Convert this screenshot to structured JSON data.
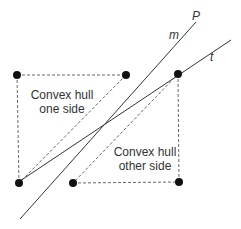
{
  "diagram": {
    "labels": {
      "line_p": "P",
      "line_m": "m",
      "line_t": "t",
      "hull_one_line1": "Convex hull",
      "hull_one_line2": "one side",
      "hull_other_line1": "Convex hull",
      "hull_other_line2": "other side"
    },
    "colors": {
      "line": "#333333",
      "point": "#111111",
      "text": "#333333"
    },
    "points": {
      "top_left": [
        17,
        75
      ],
      "top_middle": [
        126,
        75
      ],
      "top_right": [
        178,
        74
      ],
      "bottom_left": [
        19,
        183
      ],
      "bottom_middle": [
        73,
        183
      ],
      "bottom_right": [
        179,
        182
      ]
    },
    "lines": {
      "m": {
        "from": [
          20,
          219
        ],
        "to": [
          196,
          22
        ]
      },
      "t": {
        "from": [
          20,
          181
        ],
        "to": [
          231,
          40
        ]
      }
    }
  }
}
